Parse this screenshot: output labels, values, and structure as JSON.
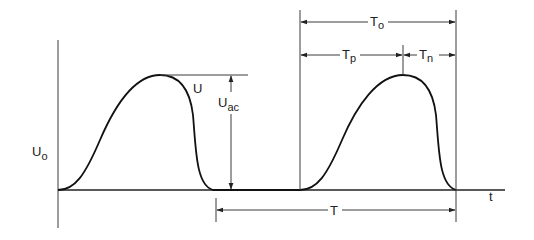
{
  "diagram": {
    "type": "pulse-waveform",
    "labels": {
      "y_axis": {
        "main": "U",
        "sub": "o"
      },
      "x_axis": "t",
      "curve": "U",
      "amplitude": {
        "main": "U",
        "sub": "ac"
      },
      "period": "T",
      "pulse_duration": {
        "main": "T",
        "sub": "o"
      },
      "rise_time": {
        "main": "T",
        "sub": "p"
      },
      "fall_time": {
        "main": "T",
        "sub": "n"
      }
    },
    "colors": {
      "line": "#222222",
      "background": "#ffffff"
    }
  }
}
